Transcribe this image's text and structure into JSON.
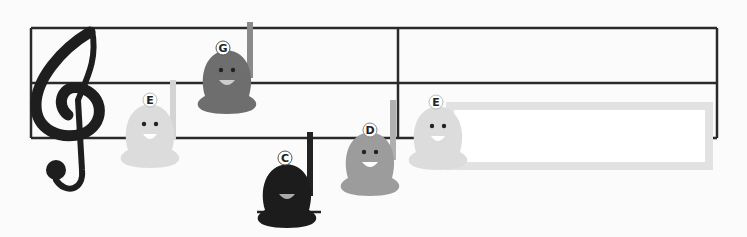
{
  "staff": {
    "line_color": "#2a2a2a",
    "clef": "treble-clef"
  },
  "bells": [
    {
      "note": "E",
      "color": "#dcdcdc",
      "handle_color": "#d4d4d4"
    },
    {
      "note": "G",
      "color": "#6e6e6e",
      "handle_color": "#8a8a8a"
    },
    {
      "note": "C",
      "color": "#1c1c1c",
      "handle_color": "#222222"
    },
    {
      "note": "D",
      "color": "#9c9c9c",
      "handle_color": "#b0b0b0"
    },
    {
      "note": "E",
      "color": "#dcdcdc",
      "handle_color": "#d4d4d4"
    }
  ],
  "answer_box": {
    "border_color": "#e2e2e2",
    "value": ""
  }
}
